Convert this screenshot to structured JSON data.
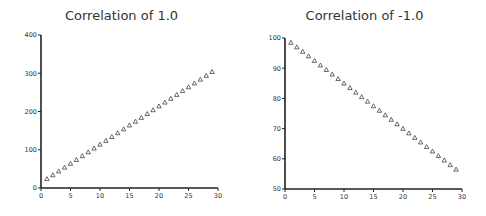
{
  "chart_data": [
    {
      "type": "scatter",
      "title": "Correlation of 1.0",
      "xlabel": "",
      "ylabel": "",
      "xlim": [
        0,
        30
      ],
      "ylim": [
        0,
        400
      ],
      "xticks": [
        0,
        5,
        10,
        15,
        20,
        25,
        30
      ],
      "yticks": [
        0,
        100,
        200,
        300,
        400
      ],
      "grid": false,
      "marker": "triangle-open",
      "x": [
        1,
        2,
        3,
        4,
        5,
        6,
        7,
        8,
        9,
        10,
        11,
        12,
        13,
        14,
        15,
        16,
        17,
        18,
        19,
        20,
        21,
        22,
        23,
        24,
        25,
        26,
        27,
        28,
        29
      ],
      "y": [
        24,
        34,
        44,
        54,
        64,
        74,
        84,
        94,
        104,
        114,
        124,
        134,
        144,
        154,
        164,
        174,
        184,
        194,
        204,
        214,
        224,
        234,
        244,
        254,
        264,
        274,
        284,
        294,
        304
      ]
    },
    {
      "type": "scatter",
      "title": "Correlation of -1.0",
      "xlabel": "",
      "ylabel": "",
      "xlim": [
        0,
        30
      ],
      "ylim": [
        50,
        100
      ],
      "xticks": [
        0,
        5,
        10,
        15,
        20,
        25,
        30
      ],
      "yticks": [
        50,
        60,
        70,
        80,
        90,
        100
      ],
      "grid": false,
      "marker": "triangle-open",
      "x": [
        1,
        2,
        3,
        4,
        5,
        6,
        7,
        8,
        9,
        10,
        11,
        12,
        13,
        14,
        15,
        16,
        17,
        18,
        19,
        20,
        21,
        22,
        23,
        24,
        25,
        26,
        27,
        28,
        29
      ],
      "y": [
        98.5,
        97,
        95.5,
        94,
        92.5,
        91,
        89.5,
        88,
        86.5,
        85,
        83.5,
        82,
        80.5,
        79,
        77.5,
        76,
        74.5,
        73,
        71.5,
        70,
        68.5,
        67,
        65.5,
        64,
        62.5,
        61,
        59.5,
        58,
        56.5
      ]
    }
  ]
}
